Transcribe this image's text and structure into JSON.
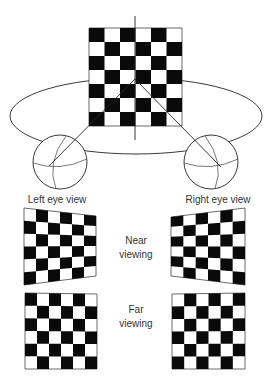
{
  "labels": {
    "left_eye_view": "Left eye view",
    "right_eye_view": "Right eye view",
    "near_line1": "Near",
    "near_line2": "viewing",
    "far_line1": "Far",
    "far_line2": "viewing"
  },
  "colors": {
    "black_square": "#0a0a0a",
    "white_square": "#ffffff",
    "line": "#222222",
    "text": "#333333"
  },
  "main_board": {
    "cols": 6,
    "rows": 7,
    "top_left_black": true,
    "corners": {
      "tl": [
        89,
        28
      ],
      "tr": [
        182,
        28
      ],
      "br": [
        182,
        126
      ],
      "bl": [
        89,
        126
      ]
    }
  },
  "fixation_point": [
    135,
    79
  ],
  "vertical_axis": {
    "x": 135,
    "y1": 16,
    "y2": 140
  },
  "ellipse": {
    "cx": 136,
    "cy": 116,
    "rx": 126,
    "ry": 38
  },
  "eyes": [
    {
      "name": "left",
      "cx": 60,
      "cy": 162,
      "r": 27,
      "nodal": [
        49,
        166
      ]
    },
    {
      "name": "right",
      "cx": 211,
      "cy": 162,
      "r": 27,
      "nodal": [
        221,
        167
      ]
    }
  ],
  "views": [
    {
      "name": "near-left",
      "cols": 6,
      "rows": 6,
      "top_left_black": false,
      "corners": {
        "tl": [
          24,
          208
        ],
        "tr": [
          96,
          216
        ],
        "br": [
          96,
          276
        ],
        "bl": [
          24,
          285
        ]
      }
    },
    {
      "name": "near-right",
      "cols": 6,
      "rows": 6,
      "top_left_black": true,
      "corners": {
        "tl": [
          171,
          217
        ],
        "tr": [
          245,
          208
        ],
        "br": [
          245,
          285
        ],
        "bl": [
          171,
          276
        ]
      }
    },
    {
      "name": "far-left",
      "cols": 6,
      "rows": 6,
      "top_left_black": true,
      "corners": {
        "tl": [
          25,
          293
        ],
        "tr": [
          97,
          294
        ],
        "br": [
          97,
          369
        ],
        "bl": [
          25,
          369
        ]
      }
    },
    {
      "name": "far-right",
      "cols": 6,
      "rows": 6,
      "top_left_black": false,
      "corners": {
        "tl": [
          172,
          294
        ],
        "tr": [
          245,
          293
        ],
        "br": [
          245,
          369
        ],
        "bl": [
          172,
          369
        ]
      }
    }
  ]
}
